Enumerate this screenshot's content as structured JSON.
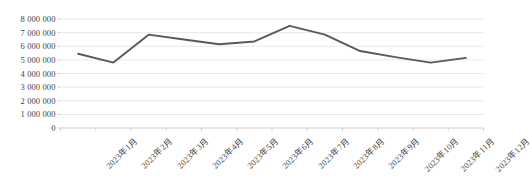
{
  "chart_data": {
    "type": "line",
    "title": "",
    "subtitle": "",
    "xlabel": "",
    "ylabel": "",
    "categories": [
      "2023年1月",
      "2023年2月",
      "2023年3月",
      "2023年4月",
      "2023年5月",
      "2023年6月",
      "2023年7月",
      "2023年8月",
      "2023年9月",
      "2023年10月",
      "2023年11月",
      "2023年12月"
    ],
    "values": [
      5450000,
      4800000,
      6850000,
      6500000,
      6150000,
      6350000,
      7500000,
      6850000,
      5650000,
      5200000,
      4800000,
      5150000
    ],
    "ylim": [
      0,
      8000000
    ],
    "ytick_values": [
      0,
      1000000,
      2000000,
      3000000,
      4000000,
      5000000,
      6000000,
      7000000,
      8000000
    ],
    "ytick_labels": [
      "0",
      "1 000 000",
      "2 000 000",
      "3 000 000",
      "4 000 000",
      "5 000 000",
      "6 000 000",
      "7 000 000",
      "8 000 000"
    ],
    "grid": true,
    "legend": false,
    "legend_position": "none",
    "series_color": "#595959",
    "grid_color": "#e8e8e8",
    "axis_color": "#d0d0d0",
    "tick_label_color": "#3f3f3f",
    "line_width": 1.9,
    "markers": false
  }
}
